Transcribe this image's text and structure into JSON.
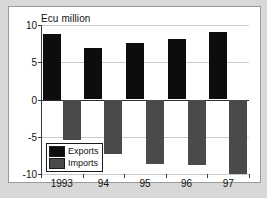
{
  "figure": {
    "background_color": "#ffffff",
    "page_background_color": "#d8d8d8",
    "border_color": "#9a9a9a"
  },
  "legend": {
    "position": "inside-bottom-left",
    "entries": [
      {
        "label": "Exports",
        "color": "#0d0d0d"
      },
      {
        "label": "Imports",
        "color": "#4a4a4a"
      }
    ]
  },
  "chart_data": {
    "type": "bar",
    "title": "Ecu million",
    "xlabel": "",
    "ylabel": "",
    "categories": [
      "1993",
      "94",
      "95",
      "96",
      "97"
    ],
    "series": [
      {
        "name": "Exports",
        "color": "#0d0d0d",
        "values": [
          8.75,
          6.9,
          7.6,
          8.15,
          9.0
        ]
      },
      {
        "name": "Imports",
        "color": "#4a4a4a",
        "values": [
          -5.5,
          -7.3,
          -8.6,
          -8.8,
          -10.0
        ]
      }
    ],
    "ylim": [
      -10,
      10
    ],
    "yticks": [
      10,
      5,
      0,
      -5,
      -10
    ],
    "ytick_labels": [
      "10",
      "5",
      "0",
      "-5",
      "-10"
    ],
    "grid": true,
    "zero_line": true,
    "legend_position": "lower left"
  }
}
